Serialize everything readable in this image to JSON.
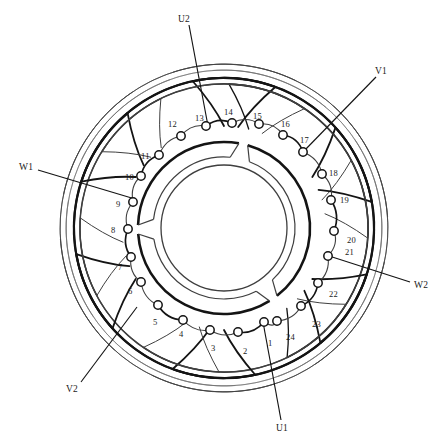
{
  "diagram": {
    "title": "",
    "type": "stator-winding-layout",
    "slot_count": 24,
    "phase_count": 3,
    "colors": {
      "stroke_dark": "#141414",
      "stroke_mid": "#3f3f3f",
      "stroke_light": "#6b6b6b",
      "background": "#ffffff",
      "text": "#1a1a1a"
    },
    "geometry": {
      "center_x": 224,
      "center_y": 228,
      "terminal_radius": 98,
      "terminal_marker_radius": 4.2,
      "hub_outer_radius": 86,
      "hub_inner_radius": 63,
      "coil_arc_radius": 150,
      "coil_span_degrees": 150
    }
  },
  "lead_labels": [
    {
      "id": "U1",
      "text": "U1",
      "x": 276,
      "y": 424,
      "connects_to_terminal": 1,
      "line": [
        281,
        420,
        263,
        322
      ]
    },
    {
      "id": "U2",
      "text": "U2",
      "x": 178,
      "y": 15,
      "connects_to_terminal": 13,
      "line": [
        189,
        25,
        208,
        126
      ]
    },
    {
      "id": "V1",
      "text": "V1",
      "x": 375,
      "y": 67,
      "connects_to_terminal": 17,
      "line": [
        376,
        77,
        303,
        152
      ]
    },
    {
      "id": "V2",
      "text": "V2",
      "x": 66,
      "y": 385,
      "connects_to_terminal": 5,
      "line": [
        81,
        382,
        137,
        307
      ]
    },
    {
      "id": "W1",
      "text": "W1",
      "x": 19,
      "y": 163,
      "connects_to_terminal": 9,
      "line": [
        38,
        170,
        135,
        199
      ]
    },
    {
      "id": "W2",
      "text": "W2",
      "x": 414,
      "y": 281,
      "connects_to_terminal": 21,
      "line": [
        410,
        282,
        326,
        255
      ]
    }
  ],
  "terminals": [
    {
      "n": 1,
      "angle": 79,
      "lx": 268,
      "ly": 339
    },
    {
      "n": 2,
      "angle": 94,
      "lx": 243,
      "ly": 347
    },
    {
      "n": 3,
      "angle": 108,
      "lx": 211,
      "ly": 344
    },
    {
      "n": 4,
      "angle": 122,
      "lx": 179,
      "ly": 330
    },
    {
      "n": 5,
      "angle": 136,
      "lx": 153,
      "ly": 318
    },
    {
      "n": 6,
      "angle": 150,
      "lx": 128,
      "ly": 287
    },
    {
      "n": 7,
      "angle": 164,
      "lx": 118,
      "ly": 263
    },
    {
      "n": 8,
      "angle": 178,
      "lx": 111,
      "ly": 226
    },
    {
      "n": 9,
      "angle": 192,
      "lx": 116,
      "ly": 200
    },
    {
      "n": 10,
      "angle": 206,
      "lx": 125,
      "ly": 173
    },
    {
      "n": 11,
      "angle": 220,
      "lx": 141,
      "ly": 152
    },
    {
      "n": 12,
      "angle": 234,
      "lx": 168,
      "ly": 120
    },
    {
      "n": 13,
      "angle": 250,
      "lx": 195,
      "ly": 114
    },
    {
      "n": 14,
      "angle": 264,
      "lx": 224,
      "ly": 108
    },
    {
      "n": 15,
      "angle": 277,
      "lx": 253,
      "ly": 112
    },
    {
      "n": 16,
      "angle": 291,
      "lx": 281,
      "ly": 120
    },
    {
      "n": 17,
      "angle": 305,
      "lx": 300,
      "ly": 136
    },
    {
      "n": 18,
      "angle": 319,
      "lx": 329,
      "ly": 169
    },
    {
      "n": 19,
      "angle": 332,
      "lx": 340,
      "ly": 196
    },
    {
      "n": 20,
      "angle": 346,
      "lx": 347,
      "ly": 236
    },
    {
      "n": 21,
      "angle": 1,
      "lx": 345,
      "ly": 248
    },
    {
      "n": 22,
      "angle": 17,
      "lx": 329,
      "ly": 290
    },
    {
      "n": 23,
      "angle": 32,
      "lx": 312,
      "ly": 320
    },
    {
      "n": 24,
      "angle": 50,
      "lx": 286,
      "ly": 333
    }
  ],
  "terminal_positions": [
    {
      "n": 1,
      "x": 264,
      "y": 322
    },
    {
      "n": 2,
      "x": 238,
      "y": 332
    },
    {
      "n": 3,
      "x": 210,
      "y": 330
    },
    {
      "n": 4,
      "x": 183,
      "y": 320
    },
    {
      "n": 5,
      "x": 158,
      "y": 305
    },
    {
      "n": 6,
      "x": 141,
      "y": 282
    },
    {
      "n": 7,
      "x": 131,
      "y": 257
    },
    {
      "n": 8,
      "x": 128,
      "y": 229
    },
    {
      "n": 9,
      "x": 133,
      "y": 202
    },
    {
      "n": 10,
      "x": 141,
      "y": 176
    },
    {
      "n": 11,
      "x": 159,
      "y": 155
    },
    {
      "n": 12,
      "x": 181,
      "y": 136
    },
    {
      "n": 13,
      "x": 206,
      "y": 126
    },
    {
      "n": 14,
      "x": 232,
      "y": 123
    },
    {
      "n": 15,
      "x": 259,
      "y": 124
    },
    {
      "n": 16,
      "x": 283,
      "y": 135
    },
    {
      "n": 17,
      "x": 303,
      "y": 152
    },
    {
      "n": 18,
      "x": 322,
      "y": 174
    },
    {
      "n": 19,
      "x": 331,
      "y": 200
    },
    {
      "n": 20,
      "x": 334,
      "y": 231
    },
    {
      "n": 21,
      "x": 328,
      "y": 256
    },
    {
      "n": 22,
      "x": 318,
      "y": 283
    },
    {
      "n": 23,
      "x": 301,
      "y": 306
    },
    {
      "n": 24,
      "x": 277,
      "y": 321
    }
  ],
  "coil_groups": [
    {
      "phase": "U",
      "start_angle": 258,
      "sweep": 152,
      "radius": 150,
      "weight": 2.1,
      "tone": "dark"
    },
    {
      "phase": "U",
      "start_angle": 272,
      "sweep": 152,
      "radius": 144,
      "weight": 1.6,
      "tone": "dark"
    },
    {
      "phase": "V",
      "start_angle": 318,
      "sweep": 152,
      "radius": 150,
      "weight": 2.1,
      "tone": "dark"
    },
    {
      "phase": "V",
      "start_angle": 332,
      "sweep": 152,
      "radius": 144,
      "weight": 1.3,
      "tone": "mid"
    },
    {
      "phase": "W",
      "start_angle": 18,
      "sweep": 152,
      "radius": 150,
      "weight": 2.1,
      "tone": "dark"
    },
    {
      "phase": "W",
      "start_angle": 32,
      "sweep": 152,
      "radius": 144,
      "weight": 1.3,
      "tone": "mid"
    },
    {
      "phase": "U",
      "start_angle": 78,
      "sweep": 152,
      "radius": 150,
      "weight": 2.1,
      "tone": "dark"
    },
    {
      "phase": "U",
      "start_angle": 92,
      "sweep": 152,
      "radius": 144,
      "weight": 1.3,
      "tone": "mid"
    },
    {
      "phase": "V",
      "start_angle": 138,
      "sweep": 152,
      "radius": 150,
      "weight": 2.1,
      "tone": "dark"
    },
    {
      "phase": "V",
      "start_angle": 152,
      "sweep": 152,
      "radius": 144,
      "weight": 1.3,
      "tone": "mid"
    },
    {
      "phase": "W",
      "start_angle": 198,
      "sweep": 152,
      "radius": 150,
      "weight": 2.1,
      "tone": "dark"
    },
    {
      "phase": "W",
      "start_angle": 212,
      "sweep": 152,
      "radius": 144,
      "weight": 1.3,
      "tone": "mid"
    }
  ],
  "hub_segments": [
    {
      "start_angle": 286,
      "end_angle": 52,
      "note": "upper-right arc segment"
    },
    {
      "start_angle": 58,
      "end_angle": 176,
      "note": "lower arc segment"
    },
    {
      "start_angle": 182,
      "end_angle": 280,
      "note": "left arc segment"
    }
  ]
}
